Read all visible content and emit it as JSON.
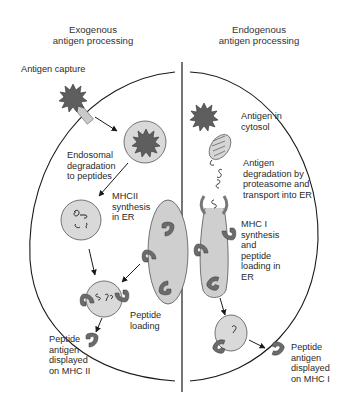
{
  "headers": {
    "left": "Exogenous\nantigen processing",
    "right": "Endogenous\nantigen processing"
  },
  "left_labels": {
    "capture": "Antigen capture",
    "endosomal": "Endosomal\ndegradation\nto peptides",
    "mhcii_synthesis": "MHCII\nsynthesis\nin ER",
    "peptide_loading": "Peptide\nloading",
    "displayed": "Peptide\nantigen\ndisplayed\non MHC II"
  },
  "right_labels": {
    "cytosol": "Antigen in\ncytosol",
    "degradation": "Antigen\ndegradation by\nproteasome and\ntransport into ER",
    "mhci_synthesis": "MHC I\nsynthesis\nand\npeptide\nloading in\nER",
    "displayed": "Peptide\nantigen\ndisplayed\non MHC I"
  },
  "colors": {
    "antigen": "#5e5e5e",
    "vesicle": "#d9d9d9",
    "er": "#cfcfcf",
    "mhc": "#6b6b6b",
    "line": "#1a1a1a"
  }
}
